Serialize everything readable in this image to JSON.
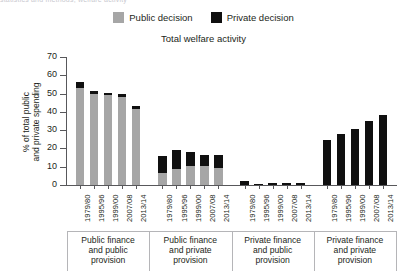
{
  "clipped_top_text": "statistics and methods; welfare activity",
  "legend": {
    "items": [
      {
        "label": "Public decision",
        "color": "#a6a6a6"
      },
      {
        "label": "Private decision",
        "color": "#101010"
      }
    ]
  },
  "chart_data": {
    "type": "bar",
    "stacked": true,
    "title": "Total welfare activity",
    "xlabel": "",
    "ylabel": "% of total public and private spending",
    "ylim": [
      0,
      70
    ],
    "yticks": [
      0,
      10,
      20,
      30,
      40,
      50,
      60,
      70
    ],
    "grid": false,
    "legend_position": "top-center",
    "categories": [
      "1979/80",
      "1995/96",
      "1999/00",
      "2007/08",
      "2013/14"
    ],
    "groups": [
      {
        "name": "Public finance and public provision",
        "categories": [
          "1979/80",
          "1995/96",
          "1999/00",
          "2007/08",
          "2013/14"
        ],
        "series": [
          {
            "name": "Public decision",
            "values": [
              53.0,
              50.0,
              49.5,
              48.0,
              41.5
            ]
          },
          {
            "name": "Private decision",
            "values": [
              3.5,
              1.5,
              1.0,
              2.0,
              1.5
            ]
          }
        ],
        "totals": [
          56.5,
          51.5,
          50.5,
          50.0,
          43.0
        ]
      },
      {
        "name": "Public finance and private provision",
        "categories": [
          "1979/80",
          "1995/96",
          "1999/00",
          "2007/08",
          "2013/14"
        ],
        "series": [
          {
            "name": "Public decision",
            "values": [
              6.5,
              9.0,
              10.5,
              10.5,
              9.5
            ]
          },
          {
            "name": "Private decision",
            "values": [
              9.5,
              10.0,
              7.5,
              6.0,
              7.0
            ]
          }
        ],
        "totals": [
          16.0,
          19.0,
          18.0,
          16.5,
          16.5
        ]
      },
      {
        "name": "Private finance and public provision",
        "categories": [
          "1979/80",
          "1995/96",
          "1999/00",
          "2007/08",
          "2013/14"
        ],
        "series": [
          {
            "name": "Public decision",
            "values": [
              0.0,
              0.0,
              0.0,
              0.0,
              0.0
            ]
          },
          {
            "name": "Private decision",
            "values": [
              2.3,
              0.7,
              0.9,
              1.2,
              0.9
            ]
          }
        ],
        "totals": [
          2.3,
          0.7,
          0.9,
          1.2,
          0.9
        ]
      },
      {
        "name": "Private finance and private provision",
        "categories": [
          "1979/80",
          "1995/96",
          "1999/00",
          "2007/08",
          "2013/14"
        ],
        "series": [
          {
            "name": "Public decision",
            "values": [
              0.0,
              0.0,
              0.0,
              0.0,
              0.0
            ]
          },
          {
            "name": "Private decision",
            "values": [
              24.5,
              28.0,
              30.5,
              35.0,
              38.5
            ]
          }
        ],
        "totals": [
          24.5,
          28.0,
          30.5,
          35.0,
          38.5
        ]
      }
    ],
    "group_labels": [
      [
        "Public finance",
        "and public",
        "provision"
      ],
      [
        "Public finance",
        "and private",
        "provision"
      ],
      [
        "Private finance",
        "and public",
        "provision"
      ],
      [
        "Private finance",
        "and private",
        "provision"
      ]
    ]
  }
}
